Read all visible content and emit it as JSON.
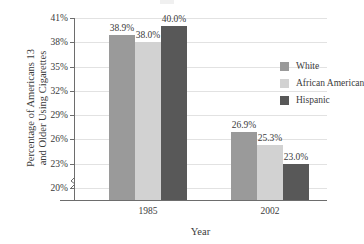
{
  "chart_data": {
    "type": "bar",
    "title": "",
    "xlabel": "Year",
    "ylabel_line1": "Percentage of Americans 13",
    "ylabel_line2": "and Older Using Cigarettes",
    "categories": [
      "1985",
      "2002"
    ],
    "series": [
      {
        "name": "White",
        "color": "#9a9a9a",
        "values": [
          38.9,
          26.9
        ],
        "labels": [
          "38.9%",
          "26.9%"
        ]
      },
      {
        "name": "African American",
        "color": "#d2d2d2",
        "values": [
          38.0,
          25.3
        ],
        "labels": [
          "38.0%",
          "25.3%"
        ]
      },
      {
        "name": "Hispanic",
        "color": "#585858",
        "values": [
          40.0,
          23.0
        ],
        "labels": [
          "40.0%",
          "23.0%"
        ]
      }
    ],
    "ylim": [
      18.5,
      41.0
    ],
    "yticks": [
      41,
      38,
      35,
      32,
      29,
      26,
      23,
      20
    ],
    "ytick_labels": [
      "41%",
      "38%",
      "35%",
      "32%",
      "29%",
      "26%",
      "23%",
      "20%"
    ],
    "grid": true,
    "axis_break": true,
    "legend_position": "upper right",
    "legend_entries": [
      "White",
      "African American",
      "Hispanic"
    ]
  },
  "axis_colors": {
    "axis_line": "#6d6d6d",
    "gridline": "#e2e2e2",
    "text": "#3b3b3b",
    "background": "#ffffff"
  }
}
